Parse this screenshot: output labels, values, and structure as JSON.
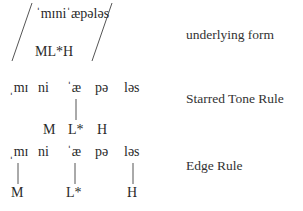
{
  "underlying": {
    "form": "ˈmɪniˈæpələs",
    "tones": "ML*H",
    "label": "underlying form"
  },
  "starred_tone_rule": {
    "syllables": [
      "ˌmɪ",
      "ni",
      "ˈæ",
      "pə",
      "ləs"
    ],
    "tones": [
      "M",
      "L*",
      "H"
    ],
    "associations": [
      {
        "syllable": "ˈæ",
        "tone": "L*"
      }
    ],
    "label": "Starred Tone Rule"
  },
  "edge_rule": {
    "syllables": [
      "ˌmɪ",
      "ni",
      "ˈæ",
      "pə",
      "ləs"
    ],
    "tones": [
      "M",
      "L*",
      "H"
    ],
    "associations": [
      {
        "syllable": "ˌmɪ",
        "tone": "M"
      },
      {
        "syllable": "ˈæ",
        "tone": "L*"
      },
      {
        "syllable": "ləs",
        "tone": "H"
      }
    ],
    "label": "Edge Rule"
  }
}
